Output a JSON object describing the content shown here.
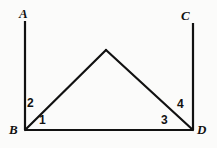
{
  "figure": {
    "type": "geometry-diagram",
    "background_color": "#fbfbfa",
    "stroke_color": "#111111",
    "stroke_width": 2,
    "canvas": {
      "width": 217,
      "height": 148
    },
    "points": {
      "A": {
        "x": 25,
        "y": 21
      },
      "B": {
        "x": 25,
        "y": 130
      },
      "C": {
        "x": 193,
        "y": 23
      },
      "D": {
        "x": 193,
        "y": 130
      },
      "apex": {
        "x": 106,
        "y": 50
      }
    },
    "segments": [
      {
        "name": "segment-AB",
        "from": "A",
        "to": "B"
      },
      {
        "name": "segment-CD",
        "from": "C",
        "to": "D"
      },
      {
        "name": "segment-BD",
        "from": "B",
        "to": "D"
      },
      {
        "name": "segment-B-apex",
        "from": "B",
        "to": "apex"
      },
      {
        "name": "segment-apex-D",
        "from": "apex",
        "to": "D"
      }
    ],
    "vertex_labels": [
      {
        "id": "A",
        "text": "A"
      },
      {
        "id": "C",
        "text": "C"
      },
      {
        "id": "B",
        "text": "B"
      },
      {
        "id": "D",
        "text": "D"
      }
    ],
    "angle_labels": [
      {
        "id": "1",
        "text": "1",
        "at_vertex": "B",
        "between": "BD and B-apex"
      },
      {
        "id": "2",
        "text": "2",
        "at_vertex": "B",
        "between": "B-apex and BA"
      },
      {
        "id": "3",
        "text": "3",
        "at_vertex": "D",
        "between": "DB and D-apex"
      },
      {
        "id": "4",
        "text": "4",
        "at_vertex": "D",
        "between": "D-apex and DC"
      }
    ]
  }
}
